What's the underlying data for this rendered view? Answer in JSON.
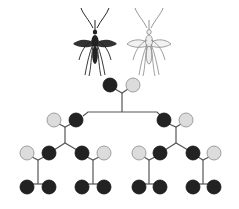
{
  "diagram": {
    "colors": {
      "dark": "#222222",
      "light": "#dcdcdc",
      "light_stroke": "#8a8a8a",
      "line": "#555555",
      "background": "#ffffff"
    },
    "mosquitoes": [
      {
        "id": "dark-mosquito",
        "cx": 95,
        "variant": "dark"
      },
      {
        "id": "light-mosquito",
        "cx": 149,
        "variant": "light"
      }
    ],
    "generations": [
      {
        "level": 1,
        "pairs": [
          {
            "nodes": [
              {
                "x": 110,
                "y": 85,
                "type": "dark"
              },
              {
                "x": 133,
                "y": 85,
                "type": "light"
              }
            ]
          }
        ]
      },
      {
        "level": 2,
        "pairs": [
          {
            "nodes": [
              {
                "x": 54,
                "y": 120,
                "type": "light"
              },
              {
                "x": 76,
                "y": 120,
                "type": "dark"
              }
            ]
          },
          {
            "nodes": [
              {
                "x": 164,
                "y": 120,
                "type": "dark"
              },
              {
                "x": 186,
                "y": 120,
                "type": "light"
              }
            ]
          }
        ]
      },
      {
        "level": 3,
        "pairs": [
          {
            "nodes": [
              {
                "x": 27,
                "y": 153,
                "type": "light"
              },
              {
                "x": 49,
                "y": 153,
                "type": "dark"
              }
            ]
          },
          {
            "nodes": [
              {
                "x": 82,
                "y": 153,
                "type": "dark"
              },
              {
                "x": 104,
                "y": 153,
                "type": "light"
              }
            ]
          },
          {
            "nodes": [
              {
                "x": 139,
                "y": 153,
                "type": "light"
              },
              {
                "x": 160,
                "y": 153,
                "type": "dark"
              }
            ]
          },
          {
            "nodes": [
              {
                "x": 193,
                "y": 153,
                "type": "dark"
              },
              {
                "x": 214,
                "y": 153,
                "type": "light"
              }
            ]
          }
        ]
      },
      {
        "level": 4,
        "pairs": [
          {
            "nodes": [
              {
                "x": 27,
                "y": 187,
                "type": "dark"
              },
              {
                "x": 49,
                "y": 187,
                "type": "dark"
              }
            ]
          },
          {
            "nodes": [
              {
                "x": 82,
                "y": 187,
                "type": "dark"
              },
              {
                "x": 104,
                "y": 187,
                "type": "dark"
              }
            ]
          },
          {
            "nodes": [
              {
                "x": 139,
                "y": 187,
                "type": "dark"
              },
              {
                "x": 160,
                "y": 187,
                "type": "dark"
              }
            ]
          },
          {
            "nodes": [
              {
                "x": 193,
                "y": 187,
                "type": "dark"
              },
              {
                "x": 214,
                "y": 187,
                "type": "dark"
              }
            ]
          }
        ]
      }
    ],
    "node_radius": 7
  }
}
